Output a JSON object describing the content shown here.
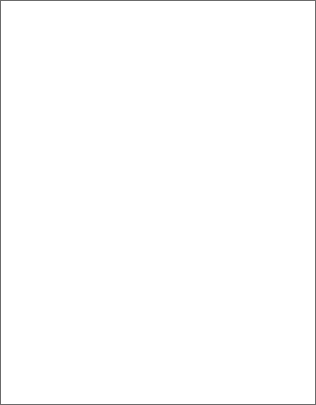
{
  "artwork": {
    "title": "Pinwheel Quilt Pattern with Diagonal Fault Band",
    "description": "Grid-ruled textile pattern of repeating pinwheel (friendship star) motifs, divided by an irregular white diagonal band separating a light upper field from a dark lower field.",
    "width": 316,
    "height": 405
  },
  "colors": {
    "page_background": "#ffffff",
    "upper_field_background": "#d9d9d9",
    "upper_motif_fill": "#9a9a9a",
    "upper_motif_center": "#ffffff",
    "lower_field_background": "#9a9a9a",
    "lower_motif_fill": "#ffffff",
    "grid_line": "#555555",
    "grid_line_minor": "#7a7a7a",
    "band_fill": "#ffffff",
    "border": "#6b6b6b"
  },
  "grid": {
    "cell_size": 7.5,
    "columns": 42,
    "rows": 54,
    "line_width": 0.8,
    "visible": true
  },
  "motif": {
    "name": "pinwheel",
    "module_px": 45,
    "arm_count": 4,
    "rotation": "clockwise"
  },
  "upper_field": {
    "label": "light-field",
    "origin_x": 38,
    "origin_y": 28,
    "cols": 6,
    "rows": 4,
    "step_x": 45,
    "step_y": 45
  },
  "lower_field": {
    "label": "dark-field",
    "origin_x": 38,
    "origin_y": 243,
    "cols": 6,
    "rows": 3,
    "step_x": 45,
    "step_y": 45
  },
  "band": {
    "label": "diagonal-fault-band",
    "thickness": 11,
    "points": [
      [
        0,
        238
      ],
      [
        26,
        231
      ],
      [
        52,
        224
      ],
      [
        74,
        220
      ],
      [
        96,
        216
      ],
      [
        118,
        211
      ],
      [
        140,
        207
      ],
      [
        150,
        206
      ],
      [
        160,
        204
      ],
      [
        172,
        201
      ],
      [
        186,
        199
      ],
      [
        196,
        196
      ],
      [
        206,
        192
      ],
      [
        220,
        187
      ],
      [
        236,
        181
      ],
      [
        252,
        175
      ],
      [
        268,
        169
      ],
      [
        284,
        163
      ],
      [
        300,
        158
      ],
      [
        316,
        154
      ]
    ]
  },
  "band_lower_edge": {
    "points": [
      [
        0,
        252
      ],
      [
        26,
        245
      ],
      [
        52,
        238
      ],
      [
        74,
        234
      ],
      [
        96,
        230
      ],
      [
        118,
        225
      ],
      [
        140,
        221
      ],
      [
        150,
        220
      ],
      [
        160,
        218
      ],
      [
        172,
        215
      ],
      [
        186,
        213
      ],
      [
        196,
        210
      ],
      [
        206,
        206
      ],
      [
        220,
        201
      ],
      [
        236,
        195
      ],
      [
        252,
        189
      ],
      [
        268,
        183
      ],
      [
        284,
        177
      ],
      [
        300,
        172
      ],
      [
        316,
        168
      ]
    ]
  }
}
